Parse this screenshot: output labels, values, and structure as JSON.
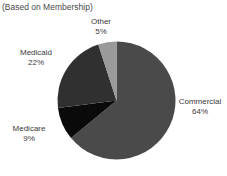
{
  "chart_data": {
    "type": "pie",
    "title": "",
    "subtitle": "(Based on Membership)",
    "xlabel": "",
    "ylabel": "",
    "legend_position": "none",
    "grid": false,
    "labels_outside": true,
    "categories": [
      "Commercial",
      "Medicare",
      "Medicaid",
      "Other"
    ],
    "values": [
      64,
      9,
      22,
      5
    ],
    "units": "percent",
    "start_angle_deg": 0,
    "direction": "clockwise",
    "slices": [
      {
        "name": "Commercial",
        "value": 64,
        "label": "Commercial",
        "pct_label": "64%",
        "color": "#4a4a4a"
      },
      {
        "name": "Medicare",
        "value": 9,
        "label": "Medicare",
        "pct_label": "9%",
        "color": "#0a0a0a"
      },
      {
        "name": "Medicaid",
        "value": 22,
        "label": "Medicaid",
        "pct_label": "22%",
        "color": "#303030"
      },
      {
        "name": "Other",
        "value": 5,
        "label": "Other",
        "pct_label": "5%",
        "color": "#9a9a9a"
      }
    ]
  },
  "colors": {
    "background": "#ffffff",
    "text": "#3b3b3b",
    "commercial": "#4a4a4a",
    "medicare": "#0a0a0a",
    "medicaid": "#303030",
    "other": "#9a9a9a"
  }
}
